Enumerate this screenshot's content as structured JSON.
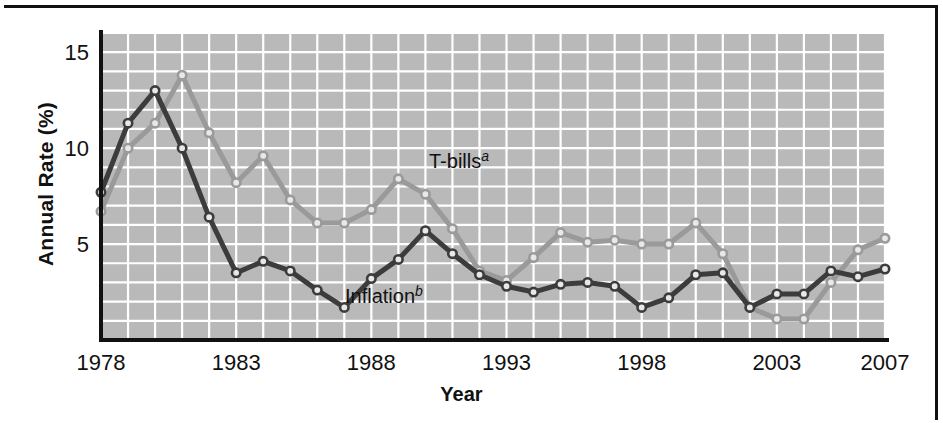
{
  "figure": {
    "y_axis_title": "Annual Rate (%)",
    "x_axis_title": "Year"
  },
  "annotations": {
    "tbills": {
      "text": "T-bills",
      "superscript": "a"
    },
    "inflation": {
      "text": "Inflation",
      "superscript": "b"
    }
  },
  "colors": {
    "plot_background": "#b9b9b9",
    "gridline": "#ffffff",
    "axis": "#111111",
    "tbills_line": "#9a9a9a",
    "inflation_line": "#3c3c3c",
    "marker_fill": "#e8e8e8"
  },
  "chart_data": {
    "type": "line",
    "title": "",
    "xlabel": "Year",
    "ylabel": "Annual Rate (%)",
    "xlim": [
      1978,
      2007
    ],
    "ylim": [
      0,
      16
    ],
    "yticks": [
      5,
      10,
      15
    ],
    "ytick_labels": [
      "5",
      "10",
      "15"
    ],
    "xticks": [
      1978,
      1983,
      1988,
      1993,
      1998,
      2003,
      2007
    ],
    "xtick_labels": [
      "1978",
      "1983",
      "1988",
      "1993",
      "1998",
      "2003",
      "2007"
    ],
    "grid": true,
    "legend": "inline-annotations",
    "x": [
      1978,
      1979,
      1980,
      1981,
      1982,
      1983,
      1984,
      1985,
      1986,
      1987,
      1988,
      1989,
      1990,
      1991,
      1992,
      1993,
      1994,
      1995,
      1996,
      1997,
      1998,
      1999,
      2000,
      2001,
      2002,
      2003,
      2004,
      2005,
      2006,
      2007
    ],
    "series": [
      {
        "name": "T-bills",
        "note": "a",
        "color": "#9a9a9a",
        "values": [
          6.7,
          10.0,
          11.3,
          13.8,
          10.8,
          8.2,
          9.6,
          7.3,
          6.1,
          6.1,
          6.8,
          8.4,
          7.6,
          5.8,
          3.6,
          3.1,
          4.3,
          5.6,
          5.1,
          5.2,
          5.0,
          5.0,
          6.1,
          4.5,
          1.7,
          1.1,
          1.1,
          3.0,
          4.7,
          5.3
        ]
      },
      {
        "name": "Inflation",
        "note": "b",
        "color": "#3c3c3c",
        "values": [
          7.7,
          11.3,
          13.0,
          10.0,
          6.4,
          3.5,
          4.1,
          3.6,
          2.6,
          1.7,
          3.2,
          4.2,
          5.7,
          4.5,
          3.4,
          2.8,
          2.5,
          2.9,
          3.0,
          2.8,
          1.7,
          2.2,
          3.4,
          3.5,
          1.7,
          2.4,
          2.4,
          3.6,
          3.3,
          3.7
        ]
      }
    ]
  }
}
